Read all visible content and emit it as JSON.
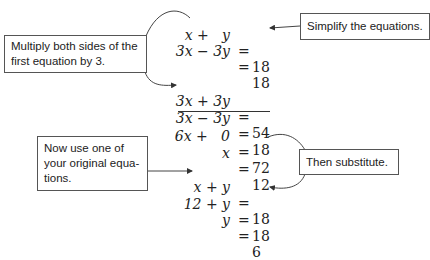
{
  "callouts": {
    "multiply": "Multiply both sides of the first equation by 3.",
    "multiply_lines": [
      "Multiply both sides of the",
      "first equation by 3."
    ],
    "simplify": "Simplify the equations.",
    "original": "Now use one of your original equations.",
    "original_lines": [
      "Now use one of",
      "your original equa-",
      "tions."
    ],
    "substitute": "Then substitute."
  },
  "equations": [
    {
      "id": "eq1",
      "lhs": "x +   y",
      "rhs": "18"
    },
    {
      "id": "eq2",
      "lhs": "3x − 3y",
      "rhs": "18"
    },
    {
      "id": "eq3",
      "lhs": "3x + 3y",
      "rhs": "54"
    },
    {
      "id": "eq4",
      "lhs": "3x − 3y",
      "rhs": "18"
    },
    {
      "id": "eq5",
      "lhs": "6x +   0",
      "rhs": "72"
    },
    {
      "id": "eq6",
      "lhs": "x",
      "rhs": "12"
    },
    {
      "id": "eq7",
      "lhs": "x + y",
      "rhs": "18"
    },
    {
      "id": "eq8",
      "lhs": "12 + y",
      "rhs": "18"
    },
    {
      "id": "eq9",
      "lhs": "y",
      "rhs": "6"
    }
  ],
  "symbols": {
    "equals": "="
  },
  "colors": {
    "ink": "#222222",
    "box_border": "#555555",
    "background": "#ffffff"
  }
}
